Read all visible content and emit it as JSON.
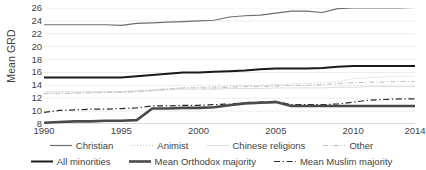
{
  "chart_data": {
    "type": "line",
    "title": "",
    "xlabel": "",
    "ylabel": "Mean GRD",
    "xlim": [
      1990,
      2014
    ],
    "ylim": [
      8,
      26
    ],
    "grid": true,
    "legend_position": "bottom",
    "xticks": [
      "1990",
      "1995",
      "2000",
      "2005",
      "2010",
      "2014"
    ],
    "yticks": [
      "8",
      "10",
      "12",
      "14",
      "16",
      "18",
      "20",
      "22",
      "24",
      "26"
    ],
    "x": [
      1990,
      1991,
      1992,
      1993,
      1994,
      1995,
      1996,
      1997,
      1998,
      1999,
      2000,
      2001,
      2002,
      2003,
      2004,
      2005,
      2006,
      2007,
      2008,
      2009,
      2010,
      2011,
      2012,
      2013,
      2014
    ],
    "series": [
      {
        "name": "Christian",
        "style": "solid",
        "width": 1.2,
        "color": "#6e6e6e",
        "values": [
          23.4,
          23.4,
          23.4,
          23.4,
          23.4,
          23.3,
          23.6,
          23.7,
          23.8,
          23.9,
          24.0,
          24.1,
          24.6,
          24.8,
          24.9,
          25.2,
          25.5,
          25.5,
          25.3,
          25.9,
          26.0,
          26.0,
          26.0,
          26.0,
          26.1
        ]
      },
      {
        "name": "Animist",
        "style": "dotted",
        "width": 1.0,
        "color": "#c6c6c6",
        "values": [
          12.8,
          12.8,
          12.8,
          12.9,
          12.9,
          13.0,
          13.2,
          13.3,
          13.5,
          13.6,
          13.7,
          13.8,
          13.9,
          14.0,
          14.0,
          14.1,
          14.2,
          14.3,
          14.4,
          14.6,
          15.0,
          15.2,
          15.3,
          15.4,
          15.4
        ]
      },
      {
        "name": "Chinese religions",
        "style": "solid",
        "width": 0.9,
        "color": "#d9d9d9",
        "values": [
          13.0,
          13.0,
          13.0,
          13.0,
          13.0,
          13.0,
          13.1,
          13.2,
          13.3,
          13.4,
          13.4,
          13.4,
          13.5,
          13.5,
          13.5,
          13.6,
          13.6,
          13.6,
          13.6,
          13.7,
          13.7,
          13.8,
          13.8,
          13.8,
          13.8
        ]
      },
      {
        "name": "Other",
        "style": "dashdot",
        "width": 1.0,
        "color": "#bfbfbf",
        "values": [
          12.7,
          12.7,
          12.8,
          12.8,
          12.9,
          12.9,
          13.0,
          13.2,
          13.4,
          13.6,
          13.6,
          13.6,
          13.7,
          13.8,
          13.8,
          13.9,
          14.0,
          14.0,
          14.1,
          14.3,
          14.4,
          14.5,
          14.5,
          14.6,
          14.6
        ]
      },
      {
        "name": "All minorities",
        "style": "solid",
        "width": 2.0,
        "color": "#1a1a1a",
        "values": [
          15.2,
          15.2,
          15.2,
          15.2,
          15.2,
          15.2,
          15.4,
          15.6,
          15.8,
          16.0,
          16.0,
          16.1,
          16.2,
          16.3,
          16.5,
          16.6,
          16.6,
          16.6,
          16.7,
          16.9,
          17.0,
          17.0,
          17.0,
          17.0,
          17.0
        ]
      },
      {
        "name": "Mean Orthodox majority",
        "style": "solid",
        "width": 2.6,
        "color": "#4a4a4a",
        "values": [
          8.2,
          8.3,
          8.4,
          8.4,
          8.5,
          8.5,
          8.6,
          10.4,
          10.4,
          10.5,
          10.5,
          10.6,
          10.9,
          11.2,
          11.3,
          11.4,
          10.8,
          10.8,
          10.8,
          10.8,
          10.8,
          10.8,
          10.8,
          10.8,
          10.8
        ]
      },
      {
        "name": "Mean Muslim majority",
        "style": "dashdot",
        "width": 1.2,
        "color": "#2b2b2b",
        "values": [
          9.8,
          10.1,
          10.2,
          10.3,
          10.3,
          10.4,
          10.5,
          10.8,
          10.8,
          10.9,
          10.9,
          11.0,
          11.1,
          11.3,
          11.4,
          11.5,
          11.0,
          11.0,
          11.0,
          11.1,
          11.4,
          11.7,
          11.8,
          11.9,
          11.9
        ]
      }
    ]
  },
  "legend": {
    "row1": [
      {
        "label": "Christian"
      },
      {
        "label": "Animist"
      },
      {
        "label": "Chinese religions"
      },
      {
        "label": "Other"
      }
    ],
    "row2": [
      {
        "label": "All minorities"
      },
      {
        "label": "Mean Orthodox majority"
      },
      {
        "label": "Mean Muslim majority"
      }
    ]
  }
}
